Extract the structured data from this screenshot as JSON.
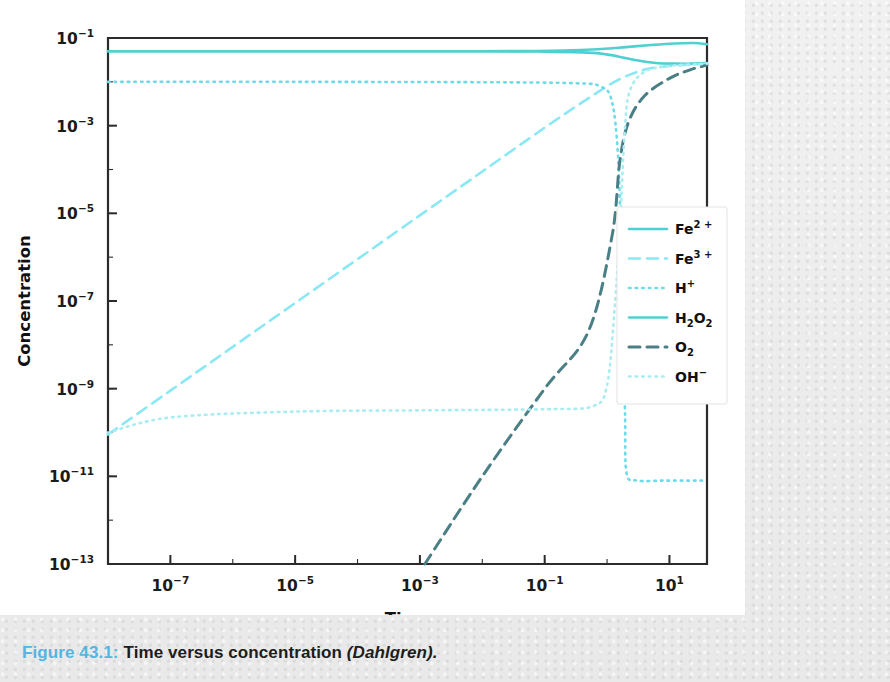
{
  "caption": {
    "figure_number": "Figure 43.1:",
    "text": " Time versus concentration ",
    "source": "(Dahlgren)."
  },
  "colors": {
    "fe2": "#4ecfd4",
    "fe3": "#8ae8f5",
    "h_plus": "#6fdbe8",
    "h2o2": "#52cfcf",
    "o2": "#4a7f85",
    "oh_minus": "#a9ecf2",
    "axis": "#2b2b2b",
    "caption_accent": "#54b6e0",
    "panel": "#ffffff",
    "page": "#efefef"
  },
  "chart_data": {
    "type": "line",
    "title": "",
    "xlabel": "Time",
    "ylabel": "Concentration",
    "xscale": "log",
    "yscale": "log",
    "xlim": [
      1e-08,
      40
    ],
    "ylim": [
      1e-13,
      0.1
    ],
    "xticks": [
      "10-7",
      "10-5",
      "10-3",
      "10-1",
      "101"
    ],
    "xtick_values": [
      1e-07,
      1e-05,
      0.001,
      0.1,
      10
    ],
    "yticks": [
      "10-1",
      "10-3",
      "10-5",
      "10-7",
      "10-9",
      "10-11",
      "10-13"
    ],
    "ytick_values": [
      0.1,
      0.001,
      1e-05,
      1e-07,
      1e-09,
      1e-11,
      1e-13
    ],
    "grid": false,
    "legend_position": "center-right",
    "series": [
      {
        "name": "Fe2+",
        "label_main": "Fe",
        "label_sup": "2 +",
        "style": "solid",
        "color": "#4ecfd4",
        "points": [
          [
            1e-08,
            0.05
          ],
          [
            1e-06,
            0.05
          ],
          [
            0.0001,
            0.05
          ],
          [
            0.01,
            0.05
          ],
          [
            0.1,
            0.049
          ],
          [
            0.4,
            0.047
          ],
          [
            0.8,
            0.044
          ],
          [
            1.5,
            0.038
          ],
          [
            3.0,
            0.031
          ],
          [
            6.0,
            0.027
          ],
          [
            12.0,
            0.026
          ],
          [
            25.0,
            0.026
          ],
          [
            40.0,
            0.027
          ]
        ]
      },
      {
        "name": "Fe3+",
        "label_main": "Fe",
        "label_sup": "3 +",
        "style": "dashed",
        "color": "#8ae8f5",
        "points": [
          [
            1e-08,
            9e-11
          ],
          [
            1e-07,
            9e-10
          ],
          [
            1e-06,
            9e-09
          ],
          [
            1e-05,
            9e-08
          ],
          [
            0.0001,
            9e-07
          ],
          [
            0.001,
            9e-06
          ],
          [
            0.01,
            9e-05
          ],
          [
            0.1,
            0.0009
          ],
          [
            0.5,
            0.0042
          ],
          [
            1.5,
            0.011
          ],
          [
            4.0,
            0.019
          ],
          [
            10.0,
            0.023
          ],
          [
            25.0,
            0.025
          ],
          [
            40.0,
            0.026
          ]
        ]
      },
      {
        "name": "H+",
        "label_main": "H",
        "label_sup": "+",
        "style": "dotted",
        "color": "#6fdbe8",
        "points": [
          [
            1e-08,
            0.01
          ],
          [
            1e-05,
            0.01
          ],
          [
            0.01,
            0.0098
          ],
          [
            0.3,
            0.0093
          ],
          [
            0.8,
            0.0078
          ],
          [
            1.2,
            0.0035
          ],
          [
            1.5,
            0.0002
          ],
          [
            1.7,
            1e-06
          ],
          [
            1.85,
            1e-08
          ],
          [
            1.95,
            2e-10
          ],
          [
            2.05,
            1.2e-11
          ],
          [
            3.0,
            8e-12
          ],
          [
            8.0,
            8e-12
          ],
          [
            20.0,
            8e-12
          ],
          [
            40.0,
            8e-12
          ]
        ]
      },
      {
        "name": "H2O2",
        "label_main": "H",
        "label_sub": "2",
        "label_main2": "O",
        "label_sub2": "2",
        "style": "solid",
        "color": "#52cfcf",
        "points": [
          [
            1e-08,
            0.05
          ],
          [
            1e-05,
            0.05
          ],
          [
            0.01,
            0.05
          ],
          [
            0.2,
            0.052
          ],
          [
            0.8,
            0.056
          ],
          [
            2.0,
            0.062
          ],
          [
            5.0,
            0.069
          ],
          [
            12.0,
            0.075
          ],
          [
            25.0,
            0.077
          ],
          [
            40.0,
            0.072
          ]
        ]
      },
      {
        "name": "O2",
        "label_main": "O",
        "label_sub": "2",
        "style": "dashed-dark",
        "color": "#4a7f85",
        "points": [
          [
            0.0012,
            1e-13
          ],
          [
            0.01,
            1e-11
          ],
          [
            0.1,
            1e-09
          ],
          [
            0.5,
            2e-08
          ],
          [
            1.2,
            3e-06
          ],
          [
            1.6,
            0.00015
          ],
          [
            2.2,
            0.0012
          ],
          [
            4.0,
            0.0048
          ],
          [
            10.0,
            0.012
          ],
          [
            22.0,
            0.019
          ],
          [
            40.0,
            0.024
          ]
        ]
      },
      {
        "name": "OH-",
        "label_main": "OH",
        "label_sup": "−",
        "style": "dotted-light",
        "color": "#a9ecf2",
        "points": [
          [
            1e-08,
            1e-10
          ],
          [
            1e-07,
            2.2e-10
          ],
          [
            1e-05,
            3e-10
          ],
          [
            0.001,
            3.2e-10
          ],
          [
            0.1,
            3.4e-10
          ],
          [
            0.6,
            4e-10
          ],
          [
            1.0,
            1.2e-09
          ],
          [
            1.3,
            5e-08
          ],
          [
            1.6,
            4e-06
          ],
          [
            1.9,
            0.0006
          ],
          [
            2.3,
            0.006
          ],
          [
            4.0,
            0.017
          ],
          [
            10.0,
            0.023
          ],
          [
            25.0,
            0.025
          ],
          [
            40.0,
            0.026
          ]
        ]
      }
    ]
  }
}
